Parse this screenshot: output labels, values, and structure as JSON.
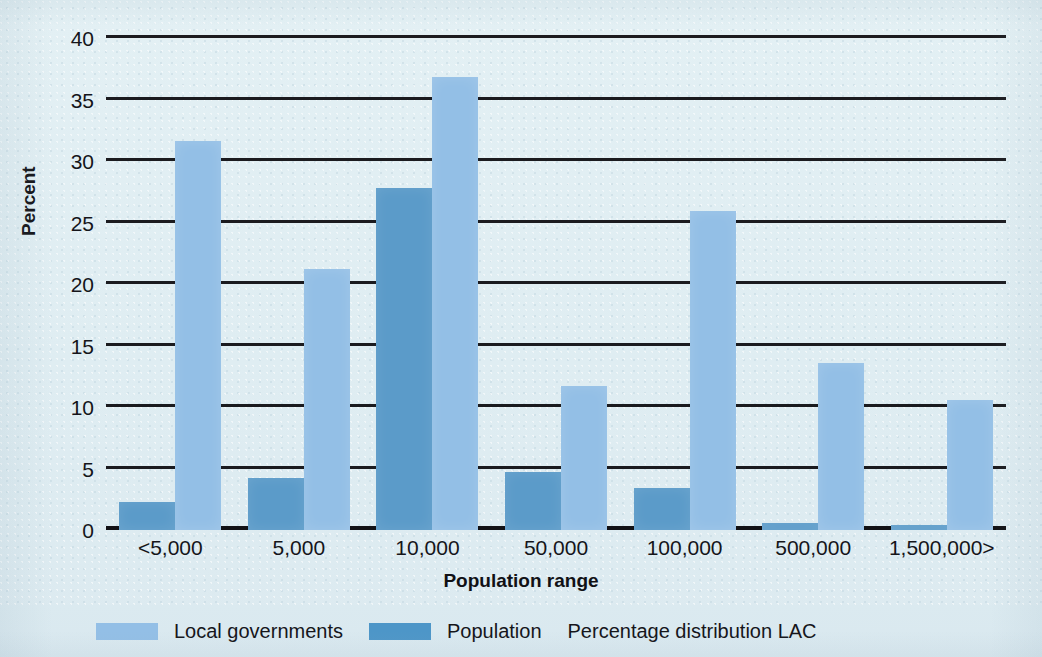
{
  "chart_data": {
    "type": "bar",
    "title": "",
    "subtitle": "",
    "xlabel": "Population range",
    "ylabel": "Percent",
    "categories": [
      "<5,000",
      "5,000",
      "10,000",
      "50,000",
      "100,000",
      "500,000",
      "1,500,000>"
    ],
    "series": [
      {
        "name": "Population",
        "color": "#5b9bc9",
        "values": [
          2.3,
          4.2,
          27.8,
          4.7,
          3.4,
          0.6,
          0.4
        ]
      },
      {
        "name": "Local governments",
        "color": "#93bfe6",
        "values": [
          31.6,
          21.2,
          36.8,
          11.7,
          25.9,
          13.6,
          10.6
        ]
      }
    ],
    "ylim": [
      0,
      40
    ],
    "yticks": [
      0,
      5,
      10,
      15,
      20,
      25,
      30,
      35,
      40
    ],
    "ytick_labels": [
      "0",
      "5",
      "10",
      "15",
      "20",
      "25",
      "30",
      "35",
      "40"
    ],
    "grid": true,
    "grid_axis": "y",
    "legend_position": "bottom",
    "annotations": [
      "Percentage distribution LAC"
    ]
  },
  "axes": {
    "y_title": "Percent",
    "x_title": "Population range"
  },
  "legend": {
    "entries": [
      {
        "label": "Local governments",
        "color": "#93bfe6"
      },
      {
        "label": "Population",
        "color": "#4d96c8"
      }
    ],
    "note": "Percentage distribution LAC"
  },
  "colors": {
    "background": "#dfedf2",
    "local_governments": "#93bfe6",
    "population": "#5b9bc9",
    "gridline": "#1b1b1f",
    "text": "#15151a"
  }
}
